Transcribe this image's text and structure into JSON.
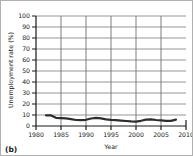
{
  "panel_label": "(b)",
  "chart_data": {
    "type": "line",
    "title": "",
    "xlabel": "Year",
    "ylabel": "Unemployment rate (%)",
    "xlim": [
      1980,
      2010
    ],
    "ylim": [
      0,
      100
    ],
    "x_ticks": [
      1980,
      1985,
      1990,
      1995,
      2000,
      2005,
      2010
    ],
    "y_ticks": [
      0,
      10,
      20,
      30,
      40,
      50,
      60,
      70,
      80,
      90,
      100
    ],
    "grid": "on",
    "legend_position": "none",
    "series": [
      {
        "name": "Unemployment rate",
        "x": [
          1982,
          1983,
          1984,
          1985,
          1986,
          1987,
          1988,
          1989,
          1990,
          1991,
          1992,
          1993,
          1994,
          1995,
          1996,
          1997,
          1998,
          1999,
          2000,
          2001,
          2002,
          2003,
          2004,
          2005,
          2006,
          2007,
          2008
        ],
        "values": [
          9.7,
          9.6,
          7.5,
          7.2,
          7.0,
          6.2,
          5.5,
          5.3,
          5.6,
          6.8,
          7.5,
          6.9,
          6.1,
          5.6,
          5.4,
          4.9,
          4.5,
          4.2,
          4.0,
          4.7,
          5.8,
          6.0,
          5.5,
          5.1,
          4.6,
          4.6,
          5.8
        ]
      }
    ],
    "colors": {
      "line": "#2d2d2d",
      "grid_h": "#8a8a8a",
      "grid_v": "#6f6f6f",
      "axis": "#1a1a1a",
      "text": "#1a1a1a",
      "border": "#b0b0b0",
      "background": "#ffffff"
    }
  }
}
